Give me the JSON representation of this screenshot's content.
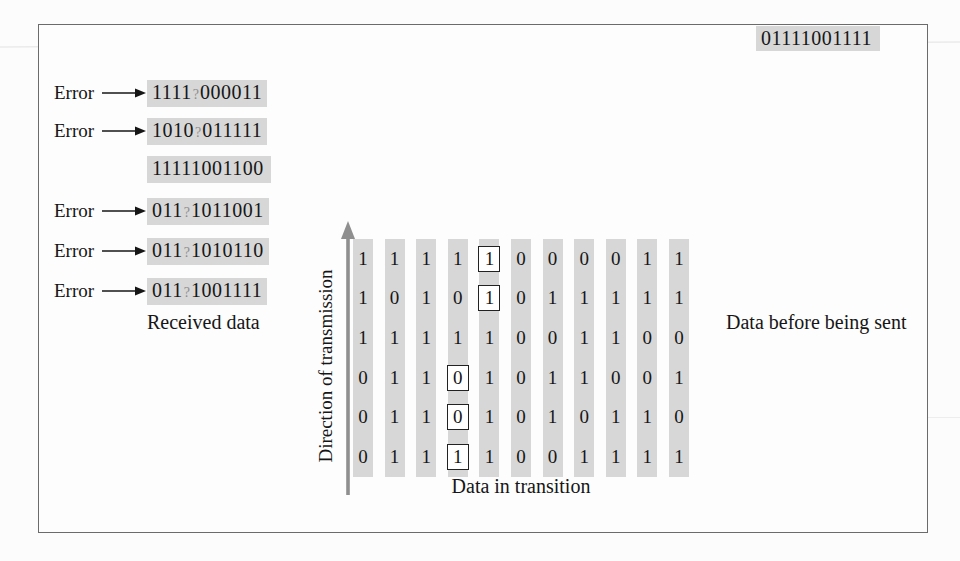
{
  "colors": {
    "highlight": "#d7d7d7",
    "arrow_gray": "#8f8f8f",
    "ink": "#161616"
  },
  "received": {
    "caption": "Received data",
    "error_label": "Error",
    "rows": [
      {
        "error": true,
        "pre": "1111",
        "q": "?",
        "post": "000011"
      },
      {
        "error": true,
        "pre": "1010",
        "q": "?",
        "post": "011111"
      },
      {
        "error": false,
        "pre": "11111001100",
        "q": "",
        "post": ""
      },
      {
        "error": true,
        "pre": "011",
        "q": "?",
        "post": "1011001"
      },
      {
        "error": true,
        "pre": "011",
        "q": "?",
        "post": "1010110"
      },
      {
        "error": true,
        "pre": "011",
        "q": "?",
        "post": "1001111"
      }
    ]
  },
  "transition": {
    "caption": "Data in transition",
    "direction_label": "Direction of transmission",
    "columns": 11,
    "rows": [
      {
        "bits": [
          "1",
          "1",
          "1",
          "1",
          "1",
          "0",
          "0",
          "0",
          "0",
          "1",
          "1"
        ],
        "boxed": 4
      },
      {
        "bits": [
          "1",
          "0",
          "1",
          "0",
          "1",
          "0",
          "1",
          "1",
          "1",
          "1",
          "1"
        ],
        "boxed": 4
      },
      {
        "bits": [
          "1",
          "1",
          "1",
          "1",
          "1",
          "0",
          "0",
          "1",
          "1",
          "0",
          "0"
        ],
        "boxed": -1
      },
      {
        "bits": [
          "0",
          "1",
          "1",
          "0",
          "1",
          "0",
          "1",
          "1",
          "0",
          "0",
          "1"
        ],
        "boxed": 3
      },
      {
        "bits": [
          "0",
          "1",
          "1",
          "0",
          "1",
          "0",
          "1",
          "0",
          "1",
          "1",
          "0"
        ],
        "boxed": 3
      },
      {
        "bits": [
          "0",
          "1",
          "1",
          "1",
          "1",
          "0",
          "0",
          "1",
          "1",
          "1",
          "1"
        ],
        "boxed": 3
      }
    ]
  },
  "sent": {
    "caption": "Data before being sent",
    "rows": [
      "11111000011",
      "10101011111",
      "11111001100",
      "01101011001",
      "01101010110",
      "01111001111"
    ]
  }
}
